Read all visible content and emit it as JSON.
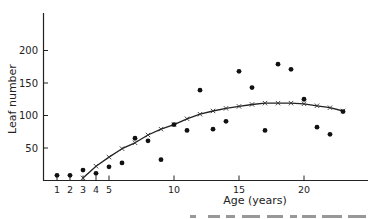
{
  "chart_data": {
    "type": "scatter",
    "title": "",
    "xlabel": "Age (years)",
    "ylabel": "Leaf number",
    "xlim": [
      0,
      24
    ],
    "ylim": [
      0,
      240
    ],
    "grid": false,
    "legend": null,
    "x_ticks": [
      1,
      2,
      3,
      4,
      5,
      10,
      15,
      20
    ],
    "x_tick_labels": [
      "1",
      "2",
      "3",
      "4",
      "5",
      "10",
      "15",
      "20"
    ],
    "y_ticks": [
      50,
      100,
      150,
      200
    ],
    "y_tick_labels": [
      "50",
      "100",
      "150",
      "200"
    ],
    "series": [
      {
        "name": "Observed",
        "marker": "dot",
        "x": [
          1,
          2,
          3,
          4,
          5,
          6,
          7,
          8,
          9,
          10,
          11,
          12,
          13,
          14,
          15,
          16,
          17,
          18,
          19,
          20,
          21,
          22,
          23
        ],
        "y": [
          8,
          8,
          16,
          11,
          21,
          27,
          65,
          61,
          32,
          86,
          77,
          139,
          79,
          91,
          168,
          143,
          77,
          179,
          171,
          125,
          82,
          71,
          106
        ]
      },
      {
        "name": "Fitted curve",
        "marker": "x",
        "line": true,
        "x": [
          3,
          4,
          5,
          6,
          7,
          8,
          9,
          10,
          11,
          12,
          13,
          14,
          15,
          16,
          17,
          18,
          19,
          20,
          21,
          22,
          23
        ],
        "y": [
          4,
          22,
          36,
          49,
          58,
          70,
          79,
          86,
          95,
          102,
          107,
          111,
          114,
          117,
          119,
          119,
          119,
          118,
          115,
          112,
          107
        ]
      }
    ]
  },
  "axes": {
    "xlabel": "Age (years)",
    "ylabel": "Leaf number"
  }
}
